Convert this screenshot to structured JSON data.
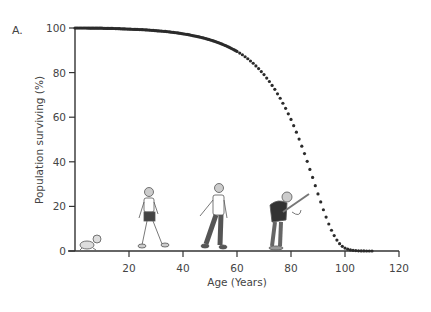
{
  "chart_data": {
    "type": "scatter",
    "panel_label": "A.",
    "title": "",
    "xlabel": "Age (Years)",
    "ylabel": "Population surviving (%)",
    "xlim": [
      0,
      120
    ],
    "ylim": [
      0,
      100
    ],
    "xticks": [
      20,
      40,
      60,
      80,
      100,
      120
    ],
    "yticks": [
      0,
      20,
      40,
      60,
      80,
      100
    ],
    "grid": false,
    "legend": null,
    "marker_color": "#2b2b2b",
    "series": [
      {
        "name": "Population surviving",
        "x": [
          0,
          2,
          4,
          6,
          8,
          10,
          12,
          14,
          16,
          18,
          20,
          22,
          24,
          26,
          28,
          30,
          32,
          34,
          36,
          38,
          40,
          42,
          44,
          46,
          48,
          50,
          52,
          54,
          56,
          58,
          60,
          62,
          64,
          66,
          68,
          70,
          72,
          74,
          76,
          78,
          80,
          81,
          82,
          83,
          84,
          85,
          86,
          87,
          88,
          89,
          90,
          91,
          92,
          93,
          94,
          95,
          96,
          97,
          98,
          99,
          100,
          101,
          102,
          103,
          104,
          105,
          106,
          107,
          108,
          109,
          110
        ],
        "values": [
          100,
          100,
          100,
          99.9,
          99.9,
          99.9,
          99.8,
          99.8,
          99.7,
          99.6,
          99.5,
          99.4,
          99.3,
          99.2,
          99.0,
          98.8,
          98.6,
          98.4,
          98.1,
          97.8,
          97.4,
          97.0,
          96.5,
          96.0,
          95.4,
          94.7,
          93.9,
          93.0,
          92.0,
          90.8,
          89.5,
          88.0,
          86.2,
          84.2,
          81.8,
          79.1,
          76.0,
          72.5,
          68.5,
          64.0,
          59.0,
          56.2,
          53.3,
          50.2,
          47.0,
          43.7,
          40.2,
          36.6,
          33.0,
          29.3,
          25.6,
          22.0,
          18.5,
          15.2,
          12.1,
          9.3,
          6.9,
          4.9,
          3.3,
          2.1,
          1.3,
          0.8,
          0.5,
          0.3,
          0.2,
          0.1,
          0.05,
          0.02,
          0.01,
          0,
          0
        ]
      }
    ],
    "annotations": [
      {
        "type": "illustration",
        "label": "crawling-baby",
        "age": 5
      },
      {
        "type": "illustration",
        "label": "walking-child",
        "age": 27
      },
      {
        "type": "illustration",
        "label": "walking-adult",
        "age": 52
      },
      {
        "type": "illustration",
        "label": "elderly-with-cane",
        "age": 82
      }
    ]
  }
}
